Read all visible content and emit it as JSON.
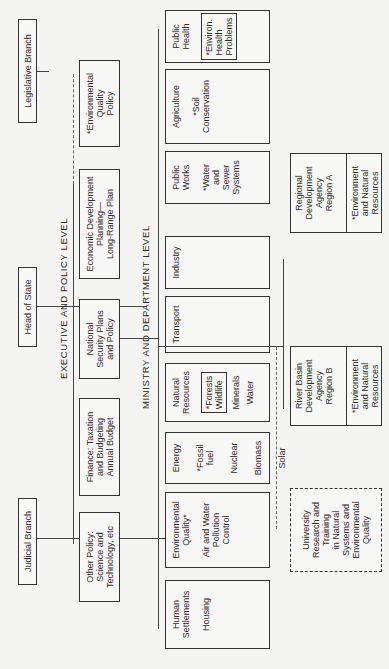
{
  "top_level": {
    "legislative": "Legislative Branch",
    "head_of_state": "Head of State",
    "judicial": "Judicial Branch"
  },
  "executive": {
    "label": "EXECUTIVE AND POLICY LEVEL",
    "boxes": [
      {
        "text": "*Environmental\nQuality\nPolicy"
      },
      {
        "text": "Economic Development\nPlanning—\nLong-Range Plan"
      },
      {
        "text": "National\nSecurity Plans\nand Policy"
      },
      {
        "text": "Finance: Taxation\nand Budgeting\nAnnual Budget"
      },
      {
        "text": "Other Policy:\nScience and\nTechnology, etc"
      }
    ]
  },
  "ministry": {
    "label": "MINISTRY AND DEPARTMENT LEVEL",
    "boxes": [
      {
        "title": "Public\nWorks",
        "items": [
          "*Water\nand\nSewer\nSystems"
        ]
      },
      {
        "title": "Agriculture",
        "items": [
          "*Soil\nConservation"
        ]
      },
      {
        "title": "Public\nHealth",
        "boxed_items": "*Environ.\nHealth\nProblems"
      },
      {
        "title": "Industry",
        "items": []
      },
      {
        "title": "Transport",
        "items": []
      },
      {
        "title": "Natural\nResources",
        "boxed_items": "*Forests\nWildlife",
        "items": [
          "Minerals",
          "Water"
        ]
      },
      {
        "title": "Energy",
        "items": [
          "*Fossil\nfuel",
          "Nuclear",
          "Biomass",
          "Solar"
        ]
      },
      {
        "title": "Environmental\nQuality*",
        "items": [
          "Air and Water\nPollution\nControl"
        ]
      },
      {
        "title": "Human\nSettlements",
        "items": [
          "Housing"
        ]
      }
    ]
  },
  "agencies": [
    {
      "title": "Regional\nDevelopment\nAgency\nRegion A",
      "sub": "*Environment\nand Natural\nResources"
    },
    {
      "title": "River Basin\nDevelopment\nAgency\nRegion B",
      "sub": "*Environment\nand Natural\nResources"
    }
  ],
  "university": {
    "text": "University\nResearch and\nTraining\nin Natural\nSystems and\nEnvironmental\nQuality"
  }
}
